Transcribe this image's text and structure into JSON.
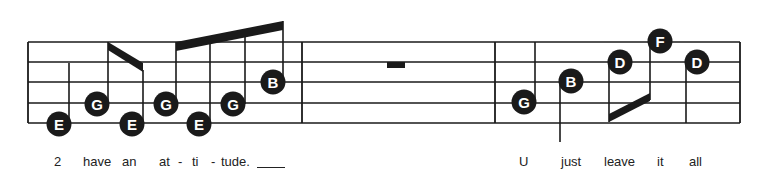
{
  "colors": {
    "ink": "#1a1a1a",
    "note_text": "#ffffff",
    "background": "#ffffff"
  },
  "staff": {
    "left": 28,
    "right": 740,
    "lines_y": [
      42,
      62,
      82,
      103,
      123
    ],
    "barlines_x": [
      28,
      302,
      495,
      740
    ]
  },
  "notes": [
    {
      "letter": "E",
      "x": 59,
      "y": 124,
      "stem": {
        "x": 69,
        "y1": 124,
        "y2": 63
      }
    },
    {
      "letter": "G",
      "x": 97,
      "y": 104,
      "stem": {
        "x": 108,
        "y1": 104,
        "y2": 42
      }
    },
    {
      "letter": "E",
      "x": 132,
      "y": 124,
      "stem": {
        "x": 143,
        "y1": 124,
        "y2": 70
      }
    },
    {
      "letter": "G",
      "x": 166,
      "y": 104,
      "stem": {
        "x": 176,
        "y1": 104,
        "y2": 42
      }
    },
    {
      "letter": "E",
      "x": 199,
      "y": 124,
      "stem": {
        "x": 210,
        "y1": 124,
        "y2": 37
      }
    },
    {
      "letter": "G",
      "x": 233,
      "y": 104,
      "stem": {
        "x": 245,
        "y1": 104,
        "y2": 29
      }
    },
    {
      "letter": "B",
      "x": 273,
      "y": 82,
      "stem": {
        "x": 283,
        "y1": 82,
        "y2": 21
      }
    },
    {
      "letter": "G",
      "x": 524,
      "y": 102,
      "stem": {
        "x": 535,
        "y1": 102,
        "y2": 42
      }
    },
    {
      "letter": "B",
      "x": 571,
      "y": 81,
      "stem": {
        "x": 560,
        "y1": 81,
        "y2": 142
      }
    },
    {
      "letter": "D",
      "x": 620,
      "y": 62,
      "stem": {
        "x": 609,
        "y1": 62,
        "y2": 122
      }
    },
    {
      "letter": "F",
      "x": 660,
      "y": 41,
      "stem": {
        "x": 650,
        "y1": 41,
        "y2": 100
      }
    },
    {
      "letter": "D",
      "x": 697,
      "y": 62,
      "stem": {
        "x": 686,
        "y1": 62,
        "y2": 123
      }
    }
  ],
  "beams": [
    {
      "points": [
        [
          108,
          42
        ],
        [
          143,
          63
        ],
        [
          143,
          72
        ],
        [
          108,
          50
        ]
      ]
    },
    {
      "points": [
        [
          176,
          42
        ],
        [
          283,
          21
        ],
        [
          283,
          30
        ],
        [
          176,
          51
        ]
      ]
    },
    {
      "points": [
        [
          609,
          114
        ],
        [
          650,
          93
        ],
        [
          650,
          101
        ],
        [
          609,
          122
        ]
      ]
    }
  ],
  "rests": [
    {
      "type": "whole",
      "x": 387,
      "y": 62,
      "width": 18,
      "height": 6
    }
  ],
  "lyrics": {
    "measure1": [
      {
        "text": "2",
        "x": 54
      },
      {
        "text": "have",
        "x": 83
      },
      {
        "text": "an",
        "x": 122
      },
      {
        "text": "at",
        "x": 159
      },
      {
        "text": "-",
        "x": 178
      },
      {
        "text": "ti",
        "x": 192
      },
      {
        "text": "-",
        "x": 211
      },
      {
        "text": "tude.",
        "x": 221
      }
    ],
    "extender": {
      "x1": 257,
      "x2": 285,
      "y": 167
    },
    "measure3": [
      {
        "text": "U",
        "x": 519
      },
      {
        "text": "just",
        "x": 561
      },
      {
        "text": "leave",
        "x": 604
      },
      {
        "text": "it",
        "x": 657
      },
      {
        "text": "all",
        "x": 689
      }
    ]
  }
}
